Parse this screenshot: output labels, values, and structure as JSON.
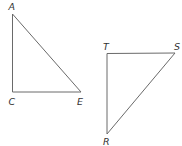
{
  "diagram": {
    "triangles": [
      {
        "name": "ACE",
        "vertices": {
          "A": {
            "label": "A",
            "x": 12.5,
            "y": 14
          },
          "C": {
            "label": "C",
            "x": 12.5,
            "y": 92
          },
          "E": {
            "label": "E",
            "x": 81,
            "y": 92
          }
        },
        "right_angle_at": "C"
      },
      {
        "name": "TSR",
        "vertices": {
          "T": {
            "label": "T",
            "x": 107,
            "y": 53.5
          },
          "S": {
            "label": "S",
            "x": 175,
            "y": 53
          },
          "R": {
            "label": "R",
            "x": 107,
            "y": 134
          }
        },
        "right_angle_at": "T"
      }
    ],
    "colors": {
      "line": "#6a6a6a",
      "label": "#333333",
      "background": "#ffffff"
    }
  }
}
